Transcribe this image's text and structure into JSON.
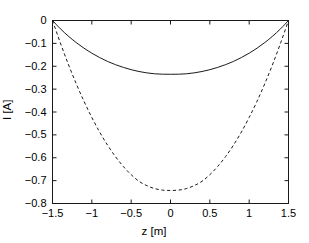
{
  "chart_data": {
    "type": "line",
    "title": "",
    "xlabel": "z [m]",
    "ylabel": "I [A]",
    "xlim": [
      -1.5,
      1.5
    ],
    "ylim": [
      -0.8,
      0.0
    ],
    "xticks": [
      -1.5,
      -1,
      -0.5,
      0,
      0.5,
      1,
      1.5
    ],
    "xticklabels": [
      "−1.5",
      "−1",
      "−0.5",
      "0",
      "0.5",
      "1",
      "1.5"
    ],
    "yticks": [
      0,
      -0.1,
      -0.2,
      -0.3,
      -0.4,
      -0.5,
      -0.6,
      -0.7,
      -0.8
    ],
    "yticklabels": [
      "0",
      "−0.1",
      "−0.2",
      "−0.3",
      "−0.4",
      "−0.5",
      "−0.6",
      "−0.7",
      "−0.8"
    ],
    "grid": false,
    "legend": null,
    "box": true,
    "series": [
      {
        "name": "solid-curve",
        "style": "solid",
        "color": "#1a1a1a",
        "linewidth": 1.0,
        "x": [
          -1.5,
          -1.4,
          -1.3,
          -1.2,
          -1.1,
          -1.0,
          -0.9,
          -0.8,
          -0.7,
          -0.6,
          -0.5,
          -0.4,
          -0.3,
          -0.2,
          -0.1,
          0.0,
          0.1,
          0.2,
          0.3,
          0.4,
          0.5,
          0.6,
          0.7,
          0.8,
          0.9,
          1.0,
          1.1,
          1.2,
          1.3,
          1.4,
          1.5
        ],
        "y": [
          0.0,
          -0.036,
          -0.068,
          -0.096,
          -0.121,
          -0.143,
          -0.162,
          -0.179,
          -0.193,
          -0.205,
          -0.215,
          -0.223,
          -0.229,
          -0.233,
          -0.2348,
          -0.235,
          -0.2348,
          -0.233,
          -0.229,
          -0.223,
          -0.215,
          -0.205,
          -0.193,
          -0.179,
          -0.162,
          -0.143,
          -0.121,
          -0.096,
          -0.068,
          -0.036,
          0.0
        ]
      },
      {
        "name": "dashed-curve",
        "style": "dashed",
        "color": "#1a1a1a",
        "linewidth": 1.0,
        "x": [
          -1.5,
          -1.4,
          -1.3,
          -1.2,
          -1.1,
          -1.0,
          -0.9,
          -0.8,
          -0.7,
          -0.6,
          -0.5,
          -0.4,
          -0.3,
          -0.2,
          -0.1,
          0.0,
          0.1,
          0.2,
          0.3,
          0.4,
          0.5,
          0.6,
          0.7,
          0.8,
          0.9,
          1.0,
          1.1,
          1.2,
          1.3,
          1.4,
          1.5
        ],
        "y": [
          0.0,
          -0.098,
          -0.19,
          -0.275,
          -0.353,
          -0.424,
          -0.488,
          -0.545,
          -0.595,
          -0.638,
          -0.674,
          -0.703,
          -0.722,
          -0.735,
          -0.7415,
          -0.743,
          -0.7415,
          -0.735,
          -0.722,
          -0.703,
          -0.674,
          -0.638,
          -0.595,
          -0.545,
          -0.488,
          -0.424,
          -0.353,
          -0.275,
          -0.19,
          -0.098,
          0.0
        ]
      }
    ]
  },
  "axes": {
    "background": "#ffffff",
    "frame_color": "#1a1a1a",
    "tick_color": "#1a1a1a"
  }
}
